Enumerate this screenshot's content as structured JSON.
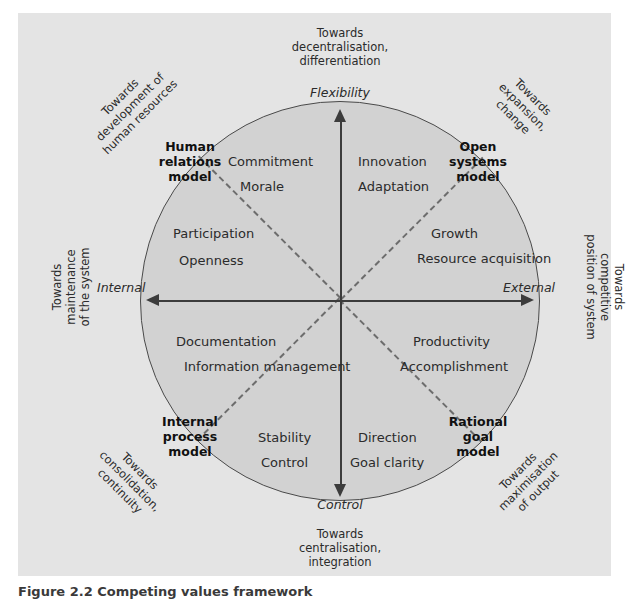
{
  "figure": {
    "caption_label": "Figure 2.2",
    "caption_text": "Competing values framework",
    "background_color": "#e4e4e4",
    "circle_color": "#d2d2d2",
    "line_color": "#3c3c3c"
  },
  "axes": {
    "top_label": "Flexibility",
    "bottom_label": "Control",
    "left_label": "Internal",
    "right_label": "External"
  },
  "outer_labels": {
    "top": "Towards\ndecentralisation,\ndifferentiation",
    "bottom": "Towards\ncentralisation,\nintegration",
    "left": "Towards\nmaintenance\nof the system",
    "right": "Towards\ncompetitive\nposition of system",
    "top_left": "Towards\ndevelopment of\nhuman resources",
    "top_right": "Towards\nexpansion,\nchange",
    "bottom_left": "Towards\nconsolidation,\ncontinuity",
    "bottom_right": "Towards\nmaximisation\nof output"
  },
  "models": {
    "human_relations": "Human\nrelations\nmodel",
    "open_systems": "Open\nsystems\nmodel",
    "internal_process": "Internal\nprocess\nmodel",
    "rational_goal": "Rational\ngoal\nmodel"
  },
  "quadrant_items": {
    "human_relations_upper": "Commitment",
    "human_relations_upper2": "Morale",
    "human_relations_lower": "Participation",
    "human_relations_lower2": "Openness",
    "open_systems_upper": "Innovation",
    "open_systems_upper2": "Adaptation",
    "open_systems_lower": "Growth",
    "open_systems_lower2": "Resource\nacquisition",
    "internal_process_upper": "Documentation",
    "internal_process_upper2": "Information\nmanagement",
    "internal_process_lower": "Stability",
    "internal_process_lower2": "Control",
    "rational_goal_upper": "Productivity",
    "rational_goal_upper2": "Accomplishment",
    "rational_goal_lower": "Direction",
    "rational_goal_lower2": "Goal clarity"
  }
}
